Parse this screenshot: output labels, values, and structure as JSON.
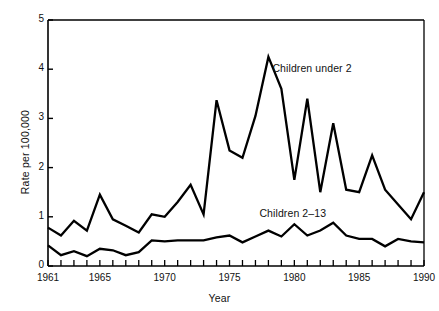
{
  "chart_data": {
    "type": "line",
    "title": "",
    "xlabel": "Year",
    "ylabel": "Rate per 100,000",
    "xlim": [
      1961,
      1990
    ],
    "ylim": [
      0,
      5
    ],
    "grid": false,
    "legend_position": "inline-annotation",
    "yticks": [
      0,
      1,
      2,
      3,
      4,
      5
    ],
    "ytick_labels": [
      "0",
      "1",
      "2",
      "3",
      "4",
      "5"
    ],
    "xticks": [
      1961,
      1965,
      1970,
      1975,
      1980,
      1985,
      1990
    ],
    "xtick_labels": [
      "1961",
      "1965",
      "1970",
      "1975",
      "1980",
      "1985",
      "1990"
    ],
    "x": [
      1961,
      1962,
      1963,
      1964,
      1965,
      1966,
      1967,
      1968,
      1969,
      1970,
      1971,
      1972,
      1973,
      1974,
      1975,
      1976,
      1977,
      1978,
      1979,
      1980,
      1981,
      1982,
      1983,
      1984,
      1985,
      1986,
      1987,
      1988,
      1989,
      1990
    ],
    "series": [
      {
        "name": "Children under 2",
        "color": "#000000",
        "values": [
          0.78,
          0.62,
          0.92,
          0.72,
          1.45,
          0.95,
          0.82,
          0.68,
          1.05,
          1.0,
          1.3,
          1.65,
          1.05,
          3.37,
          2.35,
          2.2,
          3.05,
          4.25,
          3.6,
          1.75,
          3.4,
          1.5,
          2.9,
          1.55,
          1.5,
          2.25,
          1.55,
          1.25,
          0.95,
          1.5
        ]
      },
      {
        "name": "Children 2–13",
        "color": "#000000",
        "values": [
          0.42,
          0.22,
          0.3,
          0.2,
          0.35,
          0.32,
          0.22,
          0.28,
          0.52,
          0.5,
          0.52,
          0.52,
          0.52,
          0.58,
          0.62,
          0.48,
          0.6,
          0.72,
          0.6,
          0.85,
          0.62,
          0.72,
          0.88,
          0.62,
          0.55,
          0.55,
          0.4,
          0.55,
          0.5,
          0.48
        ]
      }
    ],
    "annotations": [
      {
        "text": "Children under 2",
        "x": 1978,
        "y": 4.0
      },
      {
        "text": "Children 2–13",
        "x": 1977,
        "y": 1.05
      }
    ]
  }
}
